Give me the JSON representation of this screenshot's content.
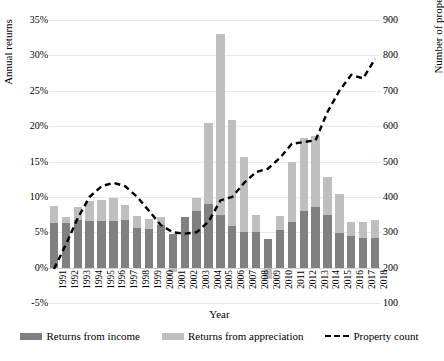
{
  "chart_data": {
    "type": "bar",
    "title": "",
    "xlabel": "Year",
    "ylabel": "Annual returns",
    "y2label": "Number of properties in index",
    "ylim": [
      -5,
      35
    ],
    "y2lim": [
      100,
      900
    ],
    "grid": true,
    "legend_position": "bottom",
    "stacked": true,
    "categories": [
      "1991",
      "1992",
      "1993",
      "1994",
      "1995",
      "1996",
      "1997",
      "1998",
      "1999",
      "2000",
      "2001",
      "2002",
      "2003",
      "2004",
      "2005",
      "2006",
      "2007",
      "2008",
      "2009",
      "2010",
      "2011",
      "2012",
      "2013",
      "2014",
      "2015",
      "2016",
      "2017",
      "2018"
    ],
    "y_tick_labels": [
      "35%",
      "30%",
      "25%",
      "20%",
      "15%",
      "10%",
      "5%",
      "0%",
      "-5%"
    ],
    "y_tick_values": [
      35,
      30,
      25,
      20,
      15,
      10,
      5,
      0,
      -5
    ],
    "y2_tick_labels": [
      "900",
      "800",
      "700",
      "600",
      "500",
      "400",
      "300",
      "200",
      "100"
    ],
    "y2_tick_values": [
      900,
      800,
      700,
      600,
      500,
      400,
      300,
      200,
      100
    ],
    "series": [
      {
        "name": "Returns from income",
        "color": "#808080",
        "values": [
          6.3,
          6.3,
          6.7,
          6.6,
          6.6,
          6.6,
          6.8,
          5.6,
          5.5,
          6.0,
          4.8,
          7.1,
          8.0,
          9.0,
          7.4,
          5.9,
          5.0,
          5.0,
          4.0,
          5.3,
          6.4,
          8.0,
          8.6,
          7.5,
          4.9,
          4.5,
          4.2,
          4.2
        ]
      },
      {
        "name": "Returns from appreciation",
        "color": "#bfbfbf",
        "values": [
          2.4,
          0.9,
          1.9,
          2.8,
          3.0,
          3.2,
          2.1,
          1.7,
          1.4,
          1.1,
          -0.6,
          0.0,
          1.8,
          11.4,
          25.6,
          14.9,
          10.7,
          2.5,
          -1.6,
          2.0,
          8.6,
          10.3,
          10.0,
          5.3,
          5.5,
          2.0,
          2.3,
          2.5
        ]
      }
    ],
    "line_series": {
      "name": "Property count",
      "color": "#000000",
      "style": "dashed",
      "values": [
        196,
        265,
        340,
        400,
        430,
        440,
        430,
        400,
        360,
        320,
        300,
        296,
        300,
        330,
        390,
        400,
        440,
        470,
        480,
        510,
        550,
        555,
        560,
        640,
        700,
        745,
        735,
        790
      ]
    }
  },
  "legend": {
    "items": [
      {
        "label": "Returns from income",
        "type": "swatch-income"
      },
      {
        "label": "Returns from appreciation",
        "type": "swatch-appr"
      },
      {
        "label": "Property count",
        "type": "swatch-line"
      }
    ]
  }
}
